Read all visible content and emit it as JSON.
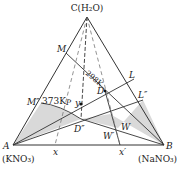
{
  "diagram": {
    "type": "ternary-phase-diagram",
    "vertices": {
      "C": {
        "label": "C(H₂O)"
      },
      "A": {
        "label": "A",
        "sublabel": "(KNO₃)"
      },
      "B": {
        "label": "B",
        "sublabel": "(NaNO₃)"
      }
    },
    "points": {
      "M": "M",
      "L": "L",
      "M2": "M″",
      "L2": "L″",
      "D": "D",
      "D2": "D″",
      "W": "W",
      "W2": "W′",
      "y": "y",
      "P": "P",
      "x": "x",
      "x2": "x′"
    },
    "isotherms": {
      "t298": "298K",
      "t373": "373K"
    },
    "colors": {
      "line": "#333333",
      "shade": "#d9d9d9",
      "dashed": "#555555"
    }
  }
}
